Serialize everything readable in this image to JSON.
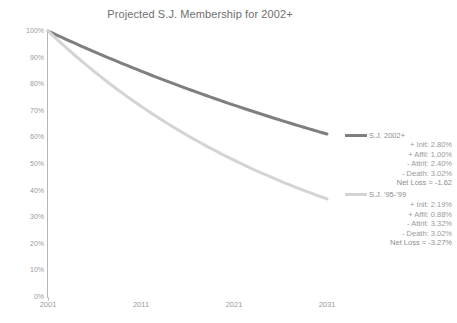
{
  "chart_data": {
    "type": "line",
    "title": "Projected S.J. Membership for 2002+",
    "xlabel": "",
    "ylabel": "",
    "x": [
      2001,
      2011,
      2021,
      2031
    ],
    "xlim": [
      2001,
      2031
    ],
    "ylim": [
      0,
      100
    ],
    "ytick_labels": [
      "100%",
      "90%",
      "80%",
      "70%",
      "60%",
      "50%",
      "40%",
      "30%",
      "20%",
      "10%",
      "0%"
    ],
    "ytick_values": [
      100,
      90,
      80,
      70,
      60,
      50,
      40,
      30,
      20,
      10,
      0
    ],
    "xtick_labels": [
      "2001",
      "2011",
      "2021",
      "2031"
    ],
    "grid": false,
    "legend_position": "right",
    "series": [
      {
        "name": "S.J. 2002+",
        "color": "#7f7f7f",
        "annual_rate_pct": -1.62,
        "x": [
          2001,
          2006,
          2011,
          2016,
          2021,
          2026,
          2031
        ],
        "values": [
          100.0,
          92.2,
          85.0,
          78.3,
          72.2,
          66.5,
          61.3
        ]
      },
      {
        "name": "S.J. '95-'99",
        "color": "#d4d4d4",
        "annual_rate_pct": -3.27,
        "x": [
          2001,
          2006,
          2011,
          2016,
          2021,
          2026,
          2031
        ],
        "values": [
          100.0,
          84.7,
          71.7,
          60.7,
          51.4,
          43.6,
          36.9
        ]
      }
    ],
    "legend": [
      {
        "name": "S.J. 2002+",
        "color": "#7f7f7f",
        "rows": [
          "+ Init: 2.80%",
          "+ Affil: 1.00%",
          "- Attrit: 2.40%",
          "- Death: 3.02%"
        ],
        "net": "Net Loss = -1.62"
      },
      {
        "name": "S.J. '95-'99",
        "color": "#d4d4d4",
        "rows": [
          "+ Init: 2.19%",
          "+ Affil: 0.88%",
          "- Attrit: 3.32%",
          "- Death: 3.02%"
        ],
        "net": "Net Loss = -3.27%"
      }
    ]
  }
}
